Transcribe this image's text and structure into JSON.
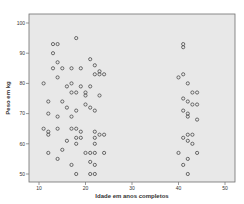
{
  "chart_data": {
    "type": "scatter",
    "title": "",
    "xlabel": "Idade em anos completos",
    "ylabel": "Peso em kg",
    "xlim": [
      8,
      52
    ],
    "ylim": [
      47,
      103
    ],
    "x_ticks": [
      10,
      20,
      30,
      40,
      50
    ],
    "y_ticks": [
      50,
      60,
      70,
      80,
      90,
      100
    ],
    "grid": false,
    "legend": null,
    "colors": {
      "plot_bg": "#e8e8e8",
      "frame": "#6f6f6f",
      "marker": "#4a4a4a"
    },
    "series": [
      {
        "name": "Peso x Idade",
        "marker": "circle-open",
        "points": [
          [
            13,
            93
          ],
          [
            14,
            93
          ],
          [
            13,
            90
          ],
          [
            14,
            87
          ],
          [
            13,
            85
          ],
          [
            15,
            85
          ],
          [
            17,
            85
          ],
          [
            19,
            85
          ],
          [
            14,
            82
          ],
          [
            17,
            80
          ],
          [
            11,
            80
          ],
          [
            16,
            79
          ],
          [
            19,
            79
          ],
          [
            18,
            77
          ],
          [
            12,
            74
          ],
          [
            15,
            74
          ],
          [
            17,
            77
          ],
          [
            20,
            77
          ],
          [
            16,
            72
          ],
          [
            18,
            71
          ],
          [
            12,
            70
          ],
          [
            14,
            69
          ],
          [
            17,
            69
          ],
          [
            11,
            65
          ],
          [
            12,
            64
          ],
          [
            12,
            63
          ],
          [
            14,
            65
          ],
          [
            17,
            65
          ],
          [
            18,
            65
          ],
          [
            19,
            64
          ],
          [
            19,
            62
          ],
          [
            12,
            57
          ],
          [
            15,
            58
          ],
          [
            14,
            55
          ],
          [
            18,
            60
          ],
          [
            20,
            57
          ],
          [
            17,
            53
          ],
          [
            21,
            54
          ],
          [
            18,
            50
          ],
          [
            22,
            50
          ],
          [
            16,
            61
          ],
          [
            18,
            62
          ],
          [
            18,
            95
          ],
          [
            21,
            88
          ],
          [
            22,
            86
          ],
          [
            23,
            84
          ],
          [
            22,
            83
          ],
          [
            23,
            83
          ],
          [
            24,
            83
          ],
          [
            21,
            79
          ],
          [
            20,
            76
          ],
          [
            23,
            76
          ],
          [
            20,
            73
          ],
          [
            21,
            72
          ],
          [
            22,
            71
          ],
          [
            22,
            64
          ],
          [
            22,
            62
          ],
          [
            23,
            63
          ],
          [
            24,
            63
          ],
          [
            22,
            60
          ],
          [
            21,
            57
          ],
          [
            22,
            57
          ],
          [
            24,
            57
          ],
          [
            22,
            53
          ],
          [
            21,
            50
          ],
          [
            41,
            93
          ],
          [
            41,
            92
          ],
          [
            40,
            82
          ],
          [
            41,
            83
          ],
          [
            42,
            80
          ],
          [
            43,
            77
          ],
          [
            44,
            77
          ],
          [
            41,
            75
          ],
          [
            42,
            74
          ],
          [
            43,
            73
          ],
          [
            44,
            73
          ],
          [
            41,
            71
          ],
          [
            42,
            70
          ],
          [
            42,
            69
          ],
          [
            44,
            68
          ],
          [
            42,
            63
          ],
          [
            41,
            62
          ],
          [
            43,
            63
          ],
          [
            42,
            61
          ],
          [
            43,
            60
          ],
          [
            40,
            57
          ],
          [
            44,
            57
          ],
          [
            42,
            55
          ],
          [
            41,
            53
          ],
          [
            42,
            50
          ]
        ]
      }
    ]
  }
}
